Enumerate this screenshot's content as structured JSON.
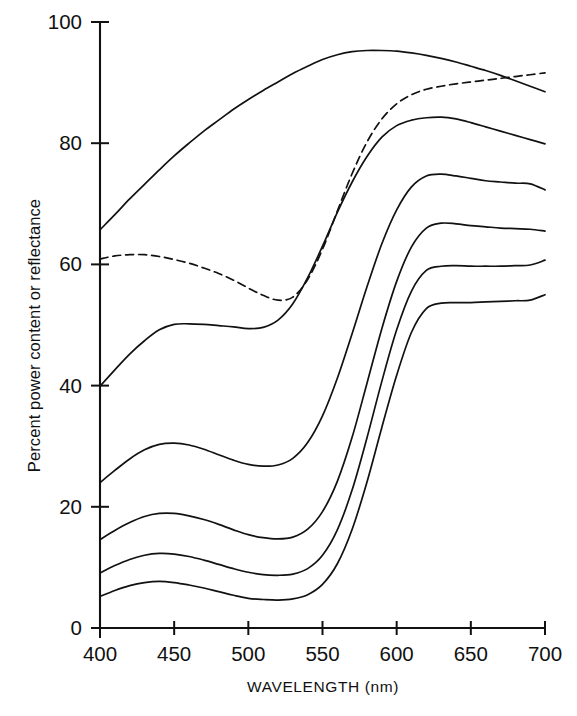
{
  "chart_data": {
    "type": "line",
    "title": "",
    "xlabel": "WAVELENGTH (nm)",
    "ylabel": "Percent power content or reflectance",
    "xlim": [
      400,
      700
    ],
    "ylim": [
      0,
      100
    ],
    "xticks": [
      400,
      450,
      500,
      550,
      600,
      650,
      700
    ],
    "xtick_labels": [
      "400",
      "450",
      "500",
      "550",
      "600",
      "650",
      "700"
    ],
    "yticks": [
      0,
      20,
      40,
      60,
      80,
      100
    ],
    "ytick_labels": [
      "0",
      "20",
      "40",
      "60",
      "80",
      "100"
    ],
    "grid": false,
    "legend": "none",
    "x": [
      400,
      410,
      420,
      430,
      440,
      450,
      460,
      470,
      480,
      490,
      500,
      510,
      520,
      530,
      540,
      550,
      560,
      570,
      580,
      590,
      600,
      610,
      620,
      630,
      640,
      650,
      660,
      670,
      680,
      690,
      700
    ],
    "series": [
      {
        "name": "curve-1-top-solid",
        "style": "solid",
        "values": [
          65.7,
          68.2,
          70.8,
          73.2,
          75.6,
          77.9,
          80.0,
          82.0,
          83.8,
          85.6,
          87.2,
          88.7,
          90.1,
          91.5,
          92.7,
          93.8,
          94.6,
          95.1,
          95.3,
          95.3,
          95.2,
          94.9,
          94.5,
          94.0,
          93.4,
          92.7,
          92.0,
          91.2,
          90.3,
          89.4,
          88.5
        ]
      },
      {
        "name": "curve-2-dashed",
        "style": "dashed",
        "values": [
          60.9,
          61.4,
          61.6,
          61.6,
          61.3,
          60.8,
          60.2,
          59.4,
          58.5,
          57.4,
          56.1,
          54.9,
          54.1,
          54.6,
          57.5,
          62.5,
          68.8,
          75.0,
          80.2,
          84.0,
          86.5,
          88.0,
          88.9,
          89.4,
          89.8,
          90.1,
          90.4,
          90.7,
          91.0,
          91.3,
          91.6
        ]
      },
      {
        "name": "curve-3-solid",
        "style": "solid",
        "values": [
          39.9,
          42.6,
          45.2,
          47.4,
          49.2,
          50.1,
          50.2,
          50.1,
          49.9,
          49.7,
          49.4,
          49.6,
          50.8,
          53.5,
          57.8,
          63.0,
          68.6,
          73.6,
          77.8,
          81.0,
          82.9,
          83.8,
          84.2,
          84.3,
          84.0,
          83.4,
          82.7,
          82.0,
          81.3,
          80.6,
          79.9
        ]
      },
      {
        "name": "curve-4-solid",
        "style": "solid",
        "values": [
          24.0,
          26.0,
          27.9,
          29.4,
          30.3,
          30.5,
          30.2,
          29.5,
          28.6,
          27.7,
          27.0,
          26.7,
          26.9,
          28.0,
          30.6,
          35.0,
          41.2,
          48.6,
          56.3,
          63.4,
          69.0,
          72.8,
          74.6,
          74.9,
          74.6,
          74.2,
          73.8,
          73.6,
          73.4,
          73.3,
          72.3
        ]
      },
      {
        "name": "curve-5-solid",
        "style": "solid",
        "values": [
          14.6,
          16.1,
          17.4,
          18.4,
          18.9,
          18.9,
          18.5,
          17.9,
          17.1,
          16.2,
          15.4,
          14.9,
          14.7,
          15.0,
          16.3,
          19.2,
          24.2,
          31.5,
          40.4,
          49.4,
          57.2,
          62.9,
          66.0,
          66.8,
          66.7,
          66.4,
          66.2,
          66.0,
          65.9,
          65.8,
          65.5
        ]
      },
      {
        "name": "curve-6-solid",
        "style": "solid",
        "values": [
          9.1,
          10.3,
          11.3,
          12.0,
          12.3,
          12.2,
          11.8,
          11.2,
          10.5,
          9.8,
          9.2,
          8.8,
          8.7,
          8.9,
          9.8,
          12.0,
          16.2,
          22.8,
          31.4,
          40.7,
          49.2,
          55.6,
          59.0,
          59.7,
          59.8,
          59.7,
          59.7,
          59.7,
          59.8,
          59.9,
          60.7
        ]
      },
      {
        "name": "curve-7-solid",
        "style": "solid",
        "values": [
          5.2,
          6.2,
          7.0,
          7.5,
          7.7,
          7.5,
          7.1,
          6.6,
          6.0,
          5.4,
          4.9,
          4.7,
          4.6,
          4.8,
          5.5,
          7.2,
          10.6,
          16.3,
          24.1,
          33.1,
          41.7,
          48.8,
          52.7,
          53.6,
          53.7,
          53.7,
          53.8,
          53.9,
          54.0,
          54.1,
          55.0
        ]
      }
    ]
  }
}
